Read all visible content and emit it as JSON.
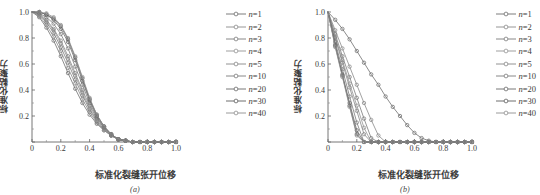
{
  "figure": {
    "panels": [
      {
        "id": "a",
        "sublabel": "(a)",
        "xlabel": "标准化裂缝张开位移",
        "ylabel": "标准化黏聚力"
      },
      {
        "id": "b",
        "sublabel": "(b)",
        "xlabel": "标准化裂缝张开位移",
        "ylabel": "标准化黏聚力"
      }
    ],
    "legend": {
      "entries": [
        {
          "label": "n=1",
          "n": 1,
          "color": "#6e6e6e"
        },
        {
          "label": "n=2",
          "n": 2,
          "color": "#8a8a8a"
        },
        {
          "label": "n=3",
          "n": 3,
          "color": "#7b7b7b"
        },
        {
          "label": "n=4",
          "n": 4,
          "color": "#949494"
        },
        {
          "label": "n=5",
          "n": 5,
          "color": "#868686"
        },
        {
          "label": "n=10",
          "n": 10,
          "color": "#7a7a7a"
        },
        {
          "label": "n=20",
          "n": 20,
          "color": "#6a6a6a"
        },
        {
          "label": "n=30",
          "n": 30,
          "color": "#5e5e5e"
        },
        {
          "label": "n=40",
          "n": 40,
          "color": "#8f8f8f"
        }
      ]
    }
  },
  "chart_data": [
    {
      "type": "line",
      "panel": "a",
      "title": "",
      "xlabel": "标准化裂缝张开位移",
      "ylabel": "标准化黏聚力",
      "xlim": [
        0,
        1.0
      ],
      "ylim": [
        0,
        1.0
      ],
      "xticks": [
        0,
        0.2,
        0.4,
        0.6,
        0.8,
        1.0
      ],
      "xticklabels": [
        "0",
        "0.2",
        "0.4",
        "0.6",
        "0.8",
        "1.0"
      ],
      "yticks": [
        0,
        0.2,
        0.4,
        0.6,
        0.8,
        1.0
      ],
      "yticklabels": [
        "",
        "0.2",
        "0.4",
        "0.6",
        "0.8",
        "1.0"
      ],
      "grid": false,
      "legend_position": "outside-right-top",
      "marker": "open-circle",
      "x": [
        0,
        0.05,
        0.1,
        0.15,
        0.2,
        0.25,
        0.3,
        0.35,
        0.4,
        0.45,
        0.5,
        0.55,
        0.6,
        0.65,
        0.7,
        0.75,
        0.8,
        0.85,
        0.9,
        0.95,
        1.0
      ],
      "series": [
        {
          "name": "n=1",
          "values": [
            1.0,
            0.96,
            0.88,
            0.78,
            0.66,
            0.53,
            0.41,
            0.3,
            0.21,
            0.14,
            0.09,
            0.05,
            0.02,
            0.01,
            0.0,
            0.0,
            0.0,
            0.0,
            0.0,
            0.0,
            0.0
          ]
        },
        {
          "name": "n=2",
          "values": [
            1.0,
            0.97,
            0.9,
            0.81,
            0.7,
            0.57,
            0.45,
            0.33,
            0.23,
            0.15,
            0.09,
            0.05,
            0.02,
            0.01,
            0.0,
            0.0,
            0.0,
            0.0,
            0.0,
            0.0,
            0.0
          ]
        },
        {
          "name": "n=3",
          "values": [
            1.0,
            0.98,
            0.92,
            0.84,
            0.73,
            0.61,
            0.48,
            0.36,
            0.25,
            0.16,
            0.1,
            0.05,
            0.02,
            0.01,
            0.0,
            0.0,
            0.0,
            0.0,
            0.0,
            0.0,
            0.0
          ]
        },
        {
          "name": "n=4",
          "values": [
            1.0,
            0.98,
            0.93,
            0.86,
            0.76,
            0.64,
            0.51,
            0.38,
            0.26,
            0.17,
            0.1,
            0.05,
            0.02,
            0.01,
            0.0,
            0.0,
            0.0,
            0.0,
            0.0,
            0.0,
            0.0
          ]
        },
        {
          "name": "n=5",
          "values": [
            1.0,
            0.99,
            0.94,
            0.87,
            0.78,
            0.66,
            0.53,
            0.4,
            0.28,
            0.18,
            0.11,
            0.05,
            0.02,
            0.01,
            0.0,
            0.0,
            0.0,
            0.0,
            0.0,
            0.0,
            0.0
          ]
        },
        {
          "name": "n=10",
          "values": [
            1.0,
            0.99,
            0.96,
            0.91,
            0.83,
            0.72,
            0.58,
            0.44,
            0.3,
            0.19,
            0.11,
            0.06,
            0.02,
            0.01,
            0.0,
            0.0,
            0.0,
            0.0,
            0.0,
            0.0,
            0.0
          ]
        },
        {
          "name": "n=20",
          "values": [
            1.0,
            1.0,
            0.98,
            0.94,
            0.87,
            0.77,
            0.63,
            0.47,
            0.32,
            0.2,
            0.12,
            0.06,
            0.02,
            0.01,
            0.0,
            0.0,
            0.0,
            0.0,
            0.0,
            0.0,
            0.0
          ]
        },
        {
          "name": "n=30",
          "values": [
            1.0,
            1.0,
            0.98,
            0.95,
            0.89,
            0.79,
            0.65,
            0.49,
            0.33,
            0.21,
            0.12,
            0.06,
            0.02,
            0.01,
            0.0,
            0.0,
            0.0,
            0.0,
            0.0,
            0.0,
            0.0
          ]
        },
        {
          "name": "n=40",
          "values": [
            1.0,
            1.0,
            0.99,
            0.96,
            0.9,
            0.8,
            0.66,
            0.5,
            0.34,
            0.21,
            0.12,
            0.06,
            0.02,
            0.01,
            0.0,
            0.0,
            0.0,
            0.0,
            0.0,
            0.0,
            0.0
          ]
        }
      ]
    },
    {
      "type": "line",
      "panel": "b",
      "title": "",
      "xlabel": "标准化裂缝张开位移",
      "ylabel": "标准化黏聚力",
      "xlim": [
        0,
        1.0
      ],
      "ylim": [
        0,
        1.0
      ],
      "xticks": [
        0,
        0.2,
        0.4,
        0.6,
        0.8,
        1.0
      ],
      "xticklabels": [
        "0",
        "0.2",
        "0.4",
        "0.6",
        "0.8",
        "1.0"
      ],
      "yticks": [
        0,
        0.2,
        0.4,
        0.6,
        0.8,
        1.0
      ],
      "yticklabels": [
        "",
        "0.2",
        "0.4",
        "0.6",
        "0.8",
        "1.0"
      ],
      "grid": false,
      "legend_position": "outside-right-top",
      "marker": "open-circle",
      "x": [
        0,
        0.05,
        0.1,
        0.15,
        0.2,
        0.25,
        0.3,
        0.35,
        0.4,
        0.45,
        0.5,
        0.55,
        0.6,
        0.65,
        0.7,
        0.75,
        0.8,
        0.85,
        0.9,
        0.95,
        1.0
      ],
      "series": [
        {
          "name": "n=1",
          "values": [
            1.0,
            0.94,
            0.87,
            0.79,
            0.7,
            0.61,
            0.52,
            0.44,
            0.35,
            0.27,
            0.2,
            0.13,
            0.07,
            0.03,
            0.01,
            0.0,
            0.0,
            0.0,
            0.0,
            0.0,
            0.0
          ]
        },
        {
          "name": "n=2",
          "values": [
            1.0,
            0.86,
            0.72,
            0.58,
            0.44,
            0.3,
            0.17,
            0.05,
            0.0,
            0.0,
            0.0,
            0.0,
            0.0,
            0.0,
            0.0,
            0.0,
            0.0,
            0.0,
            0.0,
            0.0,
            0.0
          ]
        },
        {
          "name": "n=3",
          "values": [
            1.0,
            0.83,
            0.66,
            0.5,
            0.34,
            0.18,
            0.03,
            0.0,
            0.0,
            0.0,
            0.0,
            0.0,
            0.0,
            0.0,
            0.0,
            0.0,
            0.0,
            0.0,
            0.0,
            0.0,
            0.0
          ]
        },
        {
          "name": "n=4",
          "values": [
            1.0,
            0.81,
            0.63,
            0.45,
            0.28,
            0.11,
            0.0,
            0.0,
            0.0,
            0.0,
            0.0,
            0.0,
            0.0,
            0.0,
            0.0,
            0.0,
            0.0,
            0.0,
            0.0,
            0.0,
            0.0
          ]
        },
        {
          "name": "n=5",
          "values": [
            1.0,
            0.8,
            0.61,
            0.42,
            0.24,
            0.06,
            0.0,
            0.0,
            0.0,
            0.0,
            0.0,
            0.0,
            0.0,
            0.0,
            0.0,
            0.0,
            0.0,
            0.0,
            0.0,
            0.0,
            0.0
          ]
        },
        {
          "name": "n=10",
          "values": [
            1.0,
            0.77,
            0.56,
            0.35,
            0.15,
            0.0,
            0.0,
            0.0,
            0.0,
            0.0,
            0.0,
            0.0,
            0.0,
            0.0,
            0.0,
            0.0,
            0.0,
            0.0,
            0.0,
            0.0,
            0.0
          ]
        },
        {
          "name": "n=20",
          "values": [
            1.0,
            0.75,
            0.52,
            0.3,
            0.09,
            0.0,
            0.0,
            0.0,
            0.0,
            0.0,
            0.0,
            0.0,
            0.0,
            0.0,
            0.0,
            0.0,
            0.0,
            0.0,
            0.0,
            0.0,
            0.0
          ]
        },
        {
          "name": "n=30",
          "values": [
            1.0,
            0.74,
            0.51,
            0.28,
            0.06,
            0.0,
            0.0,
            0.0,
            0.0,
            0.0,
            0.0,
            0.0,
            0.0,
            0.0,
            0.0,
            0.0,
            0.0,
            0.0,
            0.0,
            0.0,
            0.0
          ]
        },
        {
          "name": "n=40",
          "values": [
            1.0,
            0.73,
            0.5,
            0.27,
            0.05,
            0.0,
            0.0,
            0.0,
            0.0,
            0.0,
            0.0,
            0.0,
            0.0,
            0.0,
            0.0,
            0.0,
            0.0,
            0.0,
            0.0,
            0.0,
            0.0
          ]
        }
      ]
    }
  ]
}
